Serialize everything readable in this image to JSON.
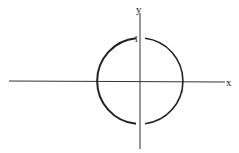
{
  "diagram": {
    "type": "unit circle on cartesian axes",
    "axes": {
      "x_label": "x",
      "y_label": "y"
    },
    "circle": {
      "center": [
        0,
        0
      ],
      "radius": 1,
      "gaps": [
        "near top at y-axis",
        "near bottom at y-axis"
      ]
    },
    "tick_labels": {
      "y_one": "1",
      "x_one": "1"
    },
    "colors": {
      "stroke": "#222222",
      "background": "#ffffff"
    }
  }
}
